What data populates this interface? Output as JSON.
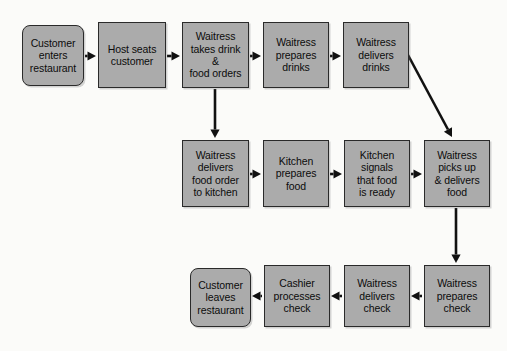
{
  "diagram": {
    "colors": {
      "node_fill": "#ababab",
      "node_border": "#2a2a2a",
      "arrow": "#111111",
      "background": "#fbfbf9"
    },
    "nodes": [
      {
        "id": "customer-enters",
        "label": "Customer\nenters\nrestaurant",
        "shape": "rounded",
        "x": 22,
        "y": 25,
        "w": 62,
        "h": 61
      },
      {
        "id": "host-seats",
        "label": "Host seats\ncustomer",
        "shape": "rect",
        "x": 98,
        "y": 22,
        "w": 68,
        "h": 66
      },
      {
        "id": "takes-orders",
        "label": "Waitress\ntakes drink &\nfood orders",
        "shape": "rect",
        "x": 182,
        "y": 22,
        "w": 67,
        "h": 66
      },
      {
        "id": "prepares-drinks",
        "label": "Waitress\nprepares\ndrinks",
        "shape": "rect",
        "x": 263,
        "y": 22,
        "w": 66,
        "h": 66
      },
      {
        "id": "delivers-drinks",
        "label": "Waitress\ndelivers\ndrinks",
        "shape": "rect",
        "x": 343,
        "y": 22,
        "w": 66,
        "h": 66
      },
      {
        "id": "delivers-food-order",
        "label": "Waitress\ndelivers\nfood order\nto kitchen",
        "shape": "rect",
        "x": 182,
        "y": 140,
        "w": 67,
        "h": 67
      },
      {
        "id": "kitchen-prepares",
        "label": "Kitchen\nprepares\nfood",
        "shape": "rect",
        "x": 263,
        "y": 140,
        "w": 66,
        "h": 67
      },
      {
        "id": "kitchen-signals",
        "label": "Kitchen\nsignals\nthat food\nis ready",
        "shape": "rect",
        "x": 344,
        "y": 140,
        "w": 66,
        "h": 67
      },
      {
        "id": "picks-up-delivers",
        "label": "Waitress\npicks up\n& delivers\nfood",
        "shape": "rect",
        "x": 424,
        "y": 140,
        "w": 66,
        "h": 67
      },
      {
        "id": "customer-leaves",
        "label": "Customer\nleaves\nrestaurant",
        "shape": "rounded",
        "x": 190,
        "y": 268,
        "w": 61,
        "h": 59
      },
      {
        "id": "cashier-processes",
        "label": "Cashier\nprocesses\ncheck",
        "shape": "rect",
        "x": 264,
        "y": 265,
        "w": 66,
        "h": 62
      },
      {
        "id": "waitress-delivers-check",
        "label": "Waitress\ndelivers\ncheck",
        "shape": "rect",
        "x": 344,
        "y": 265,
        "w": 66,
        "h": 62
      },
      {
        "id": "waitress-prepares-check",
        "label": "Waitress\nprepares\ncheck",
        "shape": "rect",
        "x": 424,
        "y": 265,
        "w": 66,
        "h": 62
      }
    ],
    "edges": [
      {
        "id": "edge-enters-to-host",
        "from": "customer-enters",
        "to": "host-seats",
        "x1": 85,
        "y1": 56,
        "x2": 96,
        "y2": 56,
        "direction": "right"
      },
      {
        "id": "edge-host-to-orders",
        "from": "host-seats",
        "to": "takes-orders",
        "x1": 167,
        "y1": 56,
        "x2": 180,
        "y2": 56,
        "direction": "right"
      },
      {
        "id": "edge-orders-to-drinks",
        "from": "takes-orders",
        "to": "prepares-drinks",
        "x1": 250,
        "y1": 56,
        "x2": 261,
        "y2": 56,
        "direction": "right"
      },
      {
        "id": "edge-drinks-to-delivers",
        "from": "prepares-drinks",
        "to": "delivers-drinks",
        "x1": 330,
        "y1": 56,
        "x2": 341,
        "y2": 56,
        "direction": "right"
      },
      {
        "id": "edge-orders-to-kitchen-order",
        "from": "takes-orders",
        "to": "delivers-food-order",
        "x1": 215,
        "y1": 89,
        "x2": 215,
        "y2": 138,
        "direction": "down"
      },
      {
        "id": "edge-delivers-drinks-to-picks-up",
        "from": "delivers-drinks",
        "to": "picks-up-delivers",
        "x1": 408,
        "y1": 55,
        "x2": 452,
        "y2": 137,
        "direction": "diagonal"
      },
      {
        "id": "edge-order-to-prepares",
        "from": "delivers-food-order",
        "to": "kitchen-prepares",
        "x1": 250,
        "y1": 174,
        "x2": 261,
        "y2": 174,
        "direction": "right"
      },
      {
        "id": "edge-prepares-to-signals",
        "from": "kitchen-prepares",
        "to": "kitchen-signals",
        "x1": 330,
        "y1": 174,
        "x2": 342,
        "y2": 174,
        "direction": "right"
      },
      {
        "id": "edge-signals-to-picks-up",
        "from": "kitchen-signals",
        "to": "picks-up-delivers",
        "x1": 411,
        "y1": 174,
        "x2": 422,
        "y2": 174,
        "direction": "right"
      },
      {
        "id": "edge-picks-up-to-prepares-check",
        "from": "picks-up-delivers",
        "to": "waitress-prepares-check",
        "x1": 456,
        "y1": 208,
        "x2": 456,
        "y2": 263,
        "direction": "down"
      },
      {
        "id": "edge-prepares-check-to-delivers-check",
        "from": "waitress-prepares-check",
        "to": "waitress-delivers-check",
        "x1": 422,
        "y1": 296,
        "x2": 411,
        "y2": 296,
        "direction": "left"
      },
      {
        "id": "edge-delivers-check-to-cashier",
        "from": "waitress-delivers-check",
        "to": "cashier-processes",
        "x1": 342,
        "y1": 296,
        "x2": 331,
        "y2": 296,
        "direction": "left"
      },
      {
        "id": "edge-cashier-to-customer-leaves",
        "from": "cashier-processes",
        "to": "customer-leaves",
        "x1": 262,
        "y1": 296,
        "x2": 252,
        "y2": 296,
        "direction": "left"
      }
    ]
  }
}
